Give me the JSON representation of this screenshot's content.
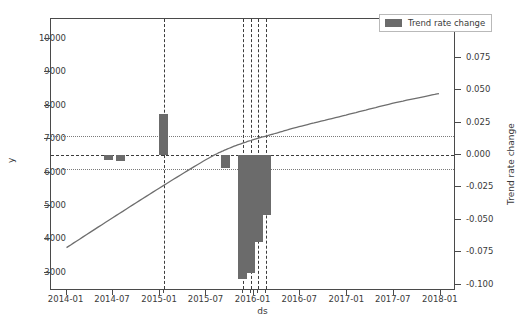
{
  "chart_data": {
    "type": "bar",
    "title": "",
    "xlabel": "ds",
    "ylabel": "y",
    "y2label": "Trend rate change",
    "grid": false,
    "legend_position": "upper right",
    "legend": [
      "Trend rate change"
    ],
    "x_axis": {
      "ticks": [
        "2014-01",
        "2014-07",
        "2015-01",
        "2015-07",
        "2016-01",
        "2016-07",
        "2017-01",
        "2017-07",
        "2018-01"
      ],
      "range": [
        "2013-11",
        "2018-03"
      ]
    },
    "y_axis_left": {
      "ticks": [
        3000,
        4000,
        5000,
        6000,
        7000,
        8000,
        9000,
        10000
      ],
      "range": [
        2450,
        10600
      ]
    },
    "y_axis_right": {
      "ticks": [
        -0.1,
        -0.075,
        -0.05,
        -0.025,
        0.0,
        0.025,
        0.05,
        0.075,
        0.1
      ],
      "tick_labels": [
        "-0.100",
        "-0.075",
        "-0.050",
        "-0.025",
        "0.000",
        "0.025",
        "0.050",
        "0.075",
        "0.100"
      ],
      "range": [
        -0.105,
        0.105
      ]
    },
    "series": [
      {
        "name": "Trend rate change",
        "type": "bar",
        "color": "#6b6b6b",
        "axis": "right",
        "points": [
          {
            "x": "2014-06-15",
            "value": -0.004
          },
          {
            "x": "2014-08-01",
            "value": -0.005
          },
          {
            "x": "2015-01-15",
            "value": 0.032
          },
          {
            "x": "2015-09-15",
            "value": -0.01
          },
          {
            "x": "2015-11-20",
            "value": -0.096
          },
          {
            "x": "2015-12-20",
            "value": -0.091
          },
          {
            "x": "2016-01-20",
            "value": -0.067
          },
          {
            "x": "2016-02-20",
            "value": -0.046
          }
        ]
      },
      {
        "name": "Trend",
        "type": "line",
        "color": "#6e6e6e",
        "axis": "left",
        "points": [
          {
            "x": "2014-01-01",
            "y": 3700
          },
          {
            "x": "2014-07-01",
            "y": 4600
          },
          {
            "x": "2015-01-01",
            "y": 5500
          },
          {
            "x": "2015-07-01",
            "y": 6350
          },
          {
            "x": "2015-10-01",
            "y": 6700
          },
          {
            "x": "2016-01-01",
            "y": 6950
          },
          {
            "x": "2016-04-01",
            "y": 7150
          },
          {
            "x": "2016-07-01",
            "y": 7350
          },
          {
            "x": "2017-01-01",
            "y": 7700
          },
          {
            "x": "2017-07-01",
            "y": 8050
          },
          {
            "x": "2018-01-01",
            "y": 8350
          }
        ]
      }
    ],
    "changepoint_lines": [
      "2015-01-15",
      "2015-11-20",
      "2015-12-20",
      "2016-01-20",
      "2016-02-20"
    ],
    "reference_lines": {
      "zero": 0.0,
      "threshold_upper": 0.0145,
      "threshold_lower": -0.011
    }
  }
}
